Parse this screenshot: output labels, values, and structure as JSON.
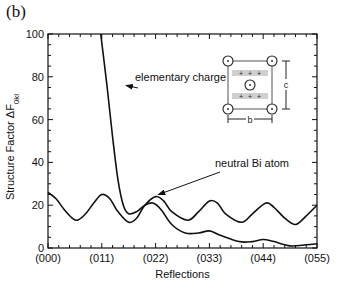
{
  "panel_label": "(b)",
  "chart_data": {
    "type": "line",
    "title": "",
    "xlabel": "Reflections",
    "ylabel": "Structure Factor ΔF0kl",
    "ylabel_main": "Structure Factor ΔF",
    "ylabel_sub": "0kl",
    "xlim": [
      0,
      5
    ],
    "ylim": [
      0,
      100
    ],
    "x_tick_positions": [
      0,
      1,
      2,
      3,
      4,
      5
    ],
    "x_tick_labels": [
      "(000)",
      "(011)",
      "(022)",
      "(033)",
      "(044)",
      "(055)"
    ],
    "y_ticks": [
      0,
      20,
      40,
      60,
      80,
      100
    ],
    "grid": false,
    "legend": "none (curves annotated with arrows)",
    "series": [
      {
        "name": "neutral Bi atom",
        "x": [
          0.0,
          0.15,
          0.3,
          0.45,
          0.55,
          0.7,
          0.85,
          1.0,
          1.15,
          1.3,
          1.5,
          1.65,
          1.8,
          2.0,
          2.15,
          2.3,
          2.6,
          2.8,
          3.0,
          3.15,
          3.3,
          3.6,
          3.8,
          4.05,
          4.2,
          4.4,
          4.6,
          4.8,
          5.0
        ],
        "values": [
          26,
          23,
          18,
          14,
          13,
          16,
          21,
          25,
          23,
          17,
          12,
          14,
          20,
          24,
          22,
          17,
          13,
          17,
          22,
          21,
          16,
          12,
          16,
          21,
          19,
          14,
          11,
          15,
          20
        ]
      },
      {
        "name": "elementary charge",
        "x": [
          0.98,
          1.1,
          1.2,
          1.3,
          1.4,
          1.5,
          1.65,
          1.8,
          1.95,
          2.1,
          2.3,
          2.55,
          2.8,
          3.0,
          3.2,
          3.55,
          3.8,
          4.0,
          4.2,
          4.5,
          4.8,
          5.0
        ],
        "values": [
          100,
          75,
          52,
          32,
          20,
          16,
          17,
          20,
          21,
          18,
          11,
          7,
          7,
          8,
          6,
          3,
          3,
          4,
          3,
          1,
          1.5,
          2
        ]
      }
    ],
    "annotations": [
      {
        "text": "elementary charge",
        "arrow_to_x": 1.45,
        "arrow_to_y": 76
      },
      {
        "text": "neutral Bi atom",
        "arrow_to_x": 2.05,
        "arrow_to_y": 24
      }
    ],
    "inset": {
      "description": "unit cell schematic (square lattice with corner and center circles, shaded rows of + charges)",
      "dimension_labels": [
        "b",
        "c"
      ],
      "charge_symbol": "+"
    }
  }
}
